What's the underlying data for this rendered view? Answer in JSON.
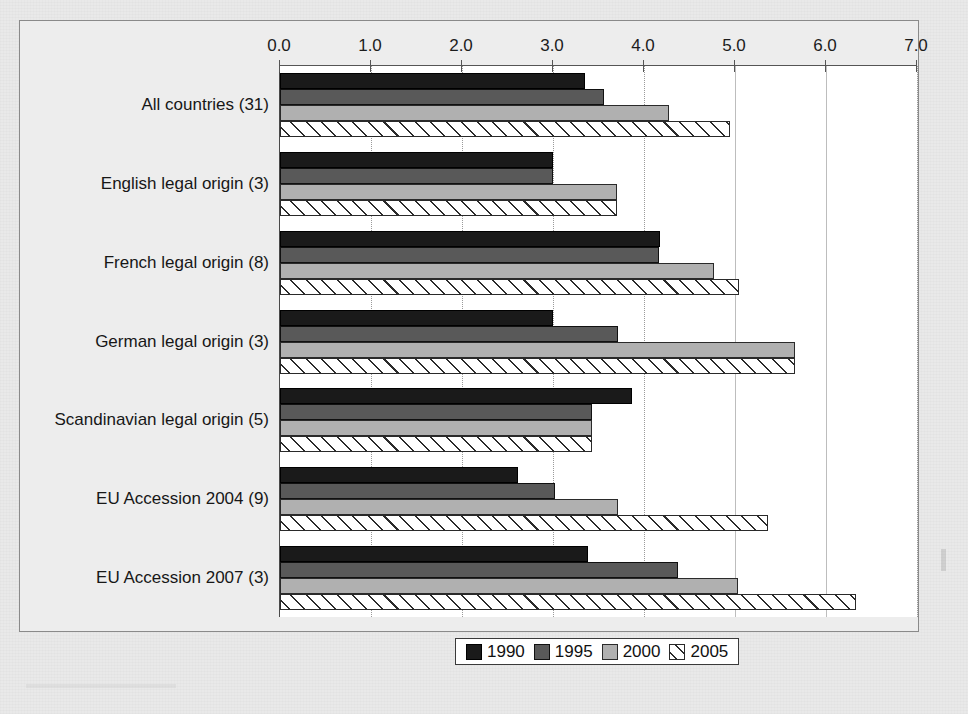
{
  "chart_data": {
    "type": "bar",
    "orientation": "horizontal",
    "title": "",
    "xlabel": "",
    "ylabel": "",
    "xlim": [
      0.0,
      7.0
    ],
    "xticks": [
      "0.0",
      "1.0",
      "2.0",
      "3.0",
      "4.0",
      "5.0",
      "6.0",
      "7.0"
    ],
    "xtick_values": [
      0.0,
      1.0,
      2.0,
      3.0,
      4.0,
      5.0,
      6.0,
      7.0
    ],
    "grid": true,
    "axis_position": "top",
    "legend_position": "bottom-center",
    "categories": [
      "All countries (31)",
      "English legal origin (3)",
      "French legal origin (8)",
      "German legal origin (3)",
      "Scandinavian legal origin (5)",
      "EU Accession 2004 (9)",
      "EU Accession 2007 (3)"
    ],
    "series": [
      {
        "name": "1990",
        "color": "#1a1a1a",
        "pattern": "solid",
        "values": [
          3.35,
          3.0,
          4.18,
          3.0,
          3.87,
          2.62,
          3.39
        ]
      },
      {
        "name": "1995",
        "color": "#595959",
        "pattern": "solid",
        "values": [
          3.56,
          3.0,
          4.16,
          3.71,
          3.43,
          3.02,
          4.37
        ]
      },
      {
        "name": "2000",
        "color": "#b0b0b0",
        "pattern": "solid",
        "values": [
          4.28,
          3.7,
          4.77,
          5.66,
          3.43,
          3.71,
          5.03
        ]
      },
      {
        "name": "2005",
        "color": "#ffffff",
        "pattern": "diagonal-hatch",
        "values": [
          4.94,
          3.7,
          5.04,
          5.66,
          3.43,
          5.36,
          6.33
        ]
      }
    ]
  },
  "legend": {
    "items": [
      {
        "label": "1990",
        "swatch": "s1990"
      },
      {
        "label": "1995",
        "swatch": "s1995"
      },
      {
        "label": "2000",
        "swatch": "s2000"
      },
      {
        "label": "2005",
        "swatch": "s2005"
      }
    ]
  }
}
